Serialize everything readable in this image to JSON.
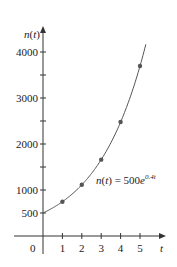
{
  "chart_data": {
    "type": "line",
    "title": "",
    "xlabel": "t",
    "ylabel": "n(t)",
    "equation_label": {
      "lhs": "n(t) = 500e",
      "exp": "0.4t"
    },
    "x_ticks": [
      "1",
      "2",
      "3",
      "4",
      "5"
    ],
    "origin_label": "0",
    "y_ticks": [
      "500",
      "1000",
      "2000",
      "3000",
      "4000"
    ],
    "y_minor_ticks": [
      1500,
      2500,
      3500
    ],
    "xlim": [
      0,
      5.8
    ],
    "ylim": [
      0,
      4600
    ],
    "grid": false,
    "series": [
      {
        "name": "n(t) = 500e^{0.4t}",
        "kind": "curve",
        "x_start": 0,
        "x_end": 5.3
      },
      {
        "name": "data points",
        "kind": "markers",
        "x": [
          1,
          2,
          3,
          4,
          5
        ],
        "values": [
          746,
          1113,
          1660,
          2477,
          3695
        ]
      }
    ]
  }
}
